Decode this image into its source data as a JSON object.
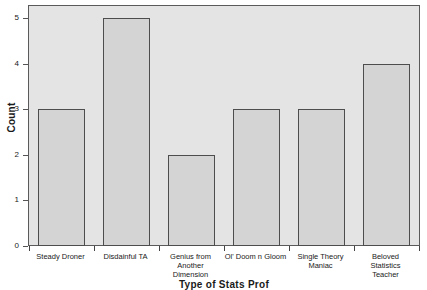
{
  "chart_data": {
    "type": "bar",
    "title": "",
    "xlabel": "Type of Stats Prof",
    "ylabel": "Count",
    "categories": [
      "Steady Droner",
      "Disdainful TA",
      "Genius from Another Dimension",
      "Ol' Doom n Gloom",
      "Single Theory Maniac",
      "Beloved Statistics Teacher"
    ],
    "category_lines": [
      [
        "Steady Droner"
      ],
      [
        "Disdainful TA"
      ],
      [
        "Genius from",
        "Another",
        "Dimension"
      ],
      [
        "Ol' Doom n Gloom"
      ],
      [
        "Single Theory",
        "Maniac"
      ],
      [
        "Beloved",
        "Statistics",
        "Teacher"
      ]
    ],
    "values": [
      3,
      5,
      2,
      3,
      3,
      4
    ],
    "ylim": [
      0,
      5
    ],
    "yticks": [
      0,
      1,
      2,
      3,
      4,
      5
    ],
    "ytick_labels": [
      "0",
      "1",
      "2",
      "3",
      "4",
      "5"
    ],
    "grid": false,
    "legend": "none",
    "bar_fill_color": "#d4d4d4",
    "bar_edge_color": "#4d4d4d",
    "plot_background_color": "#e4e4e4",
    "figure_background_color": "#ffffff",
    "axis_color": "#5a5a5a",
    "text_color": "#1a1a1a"
  }
}
